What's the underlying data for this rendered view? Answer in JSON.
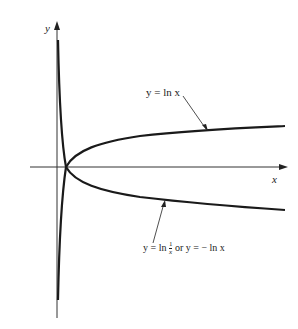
{
  "figure": {
    "y_axis_label": "y",
    "x_axis_label": "x",
    "curve1_label": "y = ln x",
    "curve2_label_part1": "y = ln",
    "curve2_frac_num": "1",
    "curve2_frac_den": "x",
    "curve2_label_part2": "or  y = − ln x",
    "colors": {
      "ink": "#1a1a1a",
      "background": "#ffffff"
    }
  }
}
